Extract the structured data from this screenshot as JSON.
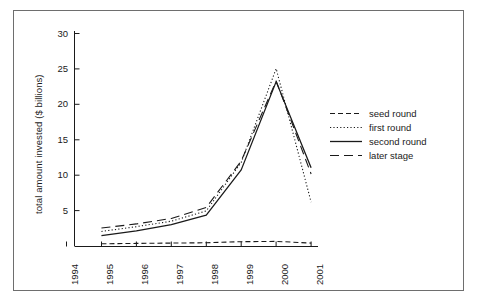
{
  "chart_data": {
    "type": "line",
    "title": "",
    "xlabel": "",
    "ylabel": "total amount invested ($ billions)",
    "x": [
      1994,
      1995,
      1996,
      1997,
      1998,
      1999,
      2000,
      2001
    ],
    "xticklabels": [
      "1994",
      "1995",
      "1996",
      "1997",
      "1998",
      "1999",
      "2000",
      "2001"
    ],
    "yticklabels": [
      "5",
      "10",
      "15",
      "20",
      "25",
      "30"
    ],
    "yticks": [
      5,
      10,
      15,
      20,
      25,
      30
    ],
    "xlim": [
      1994,
      2001
    ],
    "ylim": [
      0,
      31.5
    ],
    "grid": false,
    "legend_position": "right",
    "series": [
      {
        "name": "seed round",
        "style": "dashed",
        "color": "#1a1a1a",
        "x": [
          1995,
          1996,
          1997,
          1998,
          1999,
          2000,
          2001
        ],
        "values": [
          0.4,
          0.45,
          0.5,
          0.55,
          0.7,
          0.75,
          0.5
        ]
      },
      {
        "name": "first round",
        "style": "dotted",
        "color": "#1a1a1a",
        "x": [
          1995,
          1996,
          1997,
          1998,
          1999,
          2000,
          2001
        ],
        "values": [
          2.2,
          2.9,
          3.7,
          5.2,
          12.3,
          26.0,
          6.5
        ]
      },
      {
        "name": "second round",
        "style": "solid",
        "color": "#1a1a1a",
        "x": [
          1995,
          1996,
          1997,
          1998,
          1999,
          2000,
          2001
        ],
        "values": [
          1.6,
          2.3,
          3.2,
          4.6,
          11.2,
          24.1,
          11.5
        ]
      },
      {
        "name": "later stage",
        "style": "longdash",
        "color": "#1a1a1a",
        "x": [
          1995,
          1996,
          1997,
          1998,
          1999,
          2000,
          2001
        ],
        "values": [
          2.7,
          3.3,
          4.1,
          5.7,
          12.5,
          24.2,
          10.6
        ]
      }
    ]
  },
  "legend": {
    "items": [
      {
        "label": "seed round"
      },
      {
        "label": "first round"
      },
      {
        "label": "second round"
      },
      {
        "label": "later stage"
      }
    ]
  }
}
